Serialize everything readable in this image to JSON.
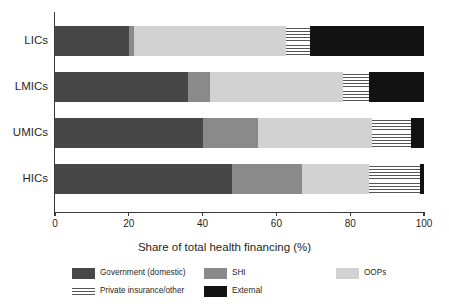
{
  "chart_data": {
    "type": "bar",
    "orientation": "horizontal",
    "stacked": true,
    "normalized": true,
    "title": "",
    "xlabel": "Share of total health financing (%)",
    "ylabel": "",
    "xlim": [
      0,
      100
    ],
    "xticks": [
      0,
      20,
      40,
      60,
      80,
      100
    ],
    "xtick_labels": [
      "0",
      "20",
      "40",
      "60",
      "80",
      "100"
    ],
    "grid": false,
    "legend_position": "bottom",
    "categories": [
      "LICs",
      "LMICs",
      "UMICs",
      "HICs"
    ],
    "series": [
      {
        "name": "Government (domestic)",
        "color": "#474747",
        "pattern": "solid",
        "values": [
          20,
          36,
          40,
          48
        ]
      },
      {
        "name": "SHI",
        "color": "#8a8a8a",
        "pattern": "solid",
        "values": [
          1.5,
          6,
          15,
          19
        ]
      },
      {
        "name": "OOPs",
        "color": "#d2d2d2",
        "pattern": "solid",
        "values": [
          41,
          36,
          31,
          18
        ]
      },
      {
        "name": "Private insurance/other",
        "color": "#ffffff",
        "pattern": "horizontal-stripes",
        "values": [
          6.5,
          7,
          10.5,
          14
        ]
      },
      {
        "name": "External",
        "color": "#121212",
        "pattern": "solid",
        "values": [
          31,
          15,
          3.5,
          1
        ]
      }
    ]
  },
  "axis": {
    "x_title": "Share of total health financing (%)",
    "ticks": [
      "0",
      "20",
      "40",
      "60",
      "80",
      "100"
    ],
    "categories": [
      "LICs",
      "LMICs",
      "UMICs",
      "HICs"
    ]
  },
  "legend": {
    "items": [
      {
        "label": "Government (domestic)",
        "swatch": "solid-dark-gray"
      },
      {
        "label": "SHI",
        "swatch": "solid-mid-gray"
      },
      {
        "label": "OOPs",
        "swatch": "solid-light-gray"
      },
      {
        "label": "Private insurance/other",
        "swatch": "horizontal-stripes"
      },
      {
        "label": "External",
        "swatch": "solid-black"
      }
    ]
  },
  "colors": {
    "government": "#474747",
    "shi": "#8a8a8a",
    "oops": "#d2d2d2",
    "private": "#ffffff",
    "external": "#121212",
    "axis": "#3a3a3a",
    "background": "#ffffff"
  }
}
